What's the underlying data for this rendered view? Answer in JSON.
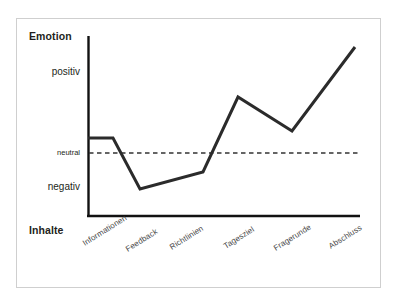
{
  "chart_data": {
    "type": "line",
    "title": "",
    "xlabel": "Inhalte",
    "ylabel": "Emotion",
    "categories": [
      "Informationen",
      "Feedback",
      "Richtlinien",
      "Tagesziel",
      "Fragerunde",
      "Abschluss"
    ],
    "ytick_labels": [
      "positiv",
      "neutral",
      "negativ"
    ],
    "ylim": [
      -2,
      2
    ],
    "grid": false,
    "legend": null,
    "series": [
      {
        "name": "Emotion",
        "values": [
          0.25,
          -1.0,
          -0.55,
          1.05,
          0.45,
          1.75
        ],
        "points_px": [
          [
            88,
            138
          ],
          [
            113,
            138
          ],
          [
            140,
            189
          ],
          [
            203,
            172
          ],
          [
            238,
            97
          ],
          [
            292,
            131
          ],
          [
            355,
            47
          ]
        ]
      }
    ],
    "reference_line": {
      "label": "neutral",
      "value": 0,
      "style": "dashed",
      "y_px": 153
    },
    "line_color": "#2b2b2b",
    "axis_color": "#111111",
    "frame_color": "#cfcfcf",
    "text_color": "#231f20",
    "xlabel_color": "#4a4a4a"
  },
  "axes": {
    "y_title": "Emotion",
    "x_title": "Inhalte"
  },
  "y_ticks": [
    {
      "label": "positiv"
    },
    {
      "label": "neutral"
    },
    {
      "label": "negativ"
    }
  ],
  "x_categories": [
    {
      "label": "Informationen"
    },
    {
      "label": "Feedback"
    },
    {
      "label": "Richtlinien"
    },
    {
      "label": "Tagesziel"
    },
    {
      "label": "Fragerunde"
    },
    {
      "label": "Abschluss"
    }
  ]
}
